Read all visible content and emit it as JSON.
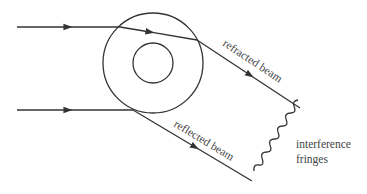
{
  "diagram": {
    "type": "optics-ray-diagram",
    "colors": {
      "line": "#333333",
      "text": "#444444",
      "background": "#ffffff"
    },
    "labels": {
      "refracted": "refracted beam",
      "reflected": "reflected beam",
      "fringes_line1": "interference",
      "fringes_line2": "fringes"
    },
    "elements": {
      "outer_circle": {
        "cx": 153,
        "cy": 63,
        "r": 50
      },
      "inner_circle": {
        "cx": 153,
        "cy": 63,
        "r": 20
      },
      "incident_beam_top": {
        "from": [
          17,
          27
        ],
        "to": [
          120,
          27
        ]
      },
      "incident_beam_bottom": {
        "from": [
          17,
          110
        ],
        "to": [
          133,
          110
        ]
      },
      "internal_refracted": {
        "from": [
          120,
          27
        ],
        "to": [
          197,
          40
        ]
      },
      "refracted_beam": {
        "from": [
          197,
          40
        ],
        "to": [
          300,
          108
        ]
      },
      "reflected_beam": {
        "from": [
          133,
          110
        ],
        "to": [
          252,
          181
        ]
      },
      "fringes": {
        "from": [
          254,
          171
        ],
        "to": [
          294,
          111
        ]
      }
    }
  }
}
